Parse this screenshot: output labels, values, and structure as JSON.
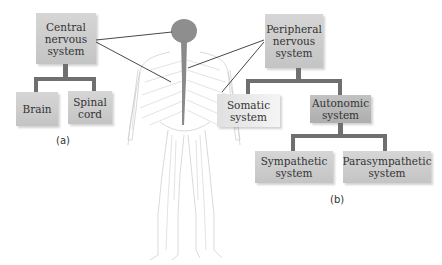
{
  "diagram": {
    "left_tree": {
      "caption": "(a)",
      "root": "Central nervous system",
      "root_lines": [
        "Central",
        "nervous",
        "system"
      ],
      "children": [
        {
          "label": "Brain",
          "lines": [
            "Brain"
          ]
        },
        {
          "label": "Spinal cord",
          "lines": [
            "Spinal",
            "cord"
          ]
        }
      ]
    },
    "right_tree": {
      "caption": "(b)",
      "root": "Peripheral nervous system",
      "root_lines": [
        "Peripheral",
        "nervous",
        "system"
      ],
      "children": [
        {
          "label": "Somatic system",
          "lines": [
            "Somatic",
            "system"
          ]
        },
        {
          "label": "Autonomic system",
          "lines": [
            "Autonomic",
            "system"
          ],
          "children": [
            {
              "label": "Sympathetic system",
              "lines": [
                "Sympathetic",
                "system"
              ]
            },
            {
              "label": "Parasympathetic system",
              "lines": [
                "Parasympathetic",
                "system"
              ]
            }
          ]
        }
      ]
    },
    "figure": {
      "name": "human-nervous-system-illustration",
      "highlight_color": "#8a8a8a",
      "nerve_color": "#c8c8c8"
    },
    "colors": {
      "box_fill": "#cccccc",
      "connector": "#6f6f6f",
      "pointer_line": "#333333"
    }
  }
}
